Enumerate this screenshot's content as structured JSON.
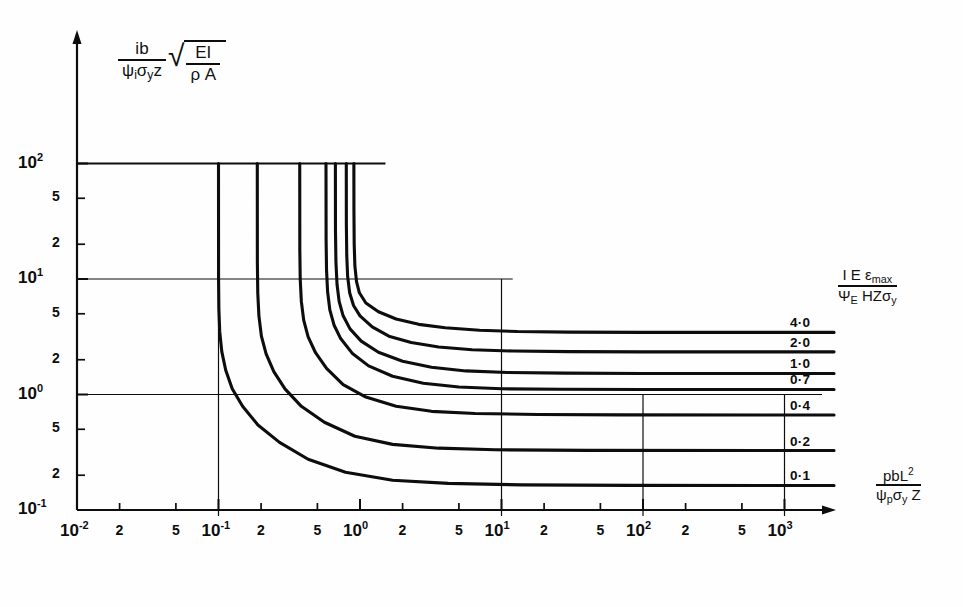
{
  "figure": {
    "kind": "engineering-design-chart",
    "background": "#fefefe",
    "ink": "#0d0d0d"
  },
  "axes": {
    "y_label": {
      "numerator": "ib",
      "denominator_psi": "ψ",
      "denominator_sub": "i",
      "denominator_rest": "σ",
      "denominator_rest_sub": "y",
      "denominator_tail": "z",
      "radical_num": "EI",
      "radical_den_rho": "ρ",
      "radical_den_A": "A"
    },
    "x_label": {
      "numerator_main": "pbL",
      "numerator_exp": "2",
      "den_psi": "ψ",
      "den_psi_sub": "p",
      "den_sigma": "σ",
      "den_sigma_sub": "y",
      "den_tail": "Z"
    },
    "right_label": {
      "num_I": "I",
      "num_E": "E",
      "num_eps": "ε",
      "num_eps_sub": "max",
      "den_psi": "Ψ",
      "den_psi_sub": "E",
      "den_rest": "HZσ",
      "den_rest_sub": "y"
    },
    "x_decades": [
      {
        "label": "10",
        "exp": "-2",
        "value": -2
      },
      {
        "label": "10",
        "exp": "-1",
        "value": -1
      },
      {
        "label": "10",
        "exp": "0",
        "value": 0
      },
      {
        "label": "10",
        "exp": "1",
        "value": 1
      },
      {
        "label": "10",
        "exp": "2",
        "value": 2
      },
      {
        "label": "10",
        "exp": "3",
        "value": 3
      }
    ],
    "x_minor_labels": [
      "2",
      "5"
    ],
    "y_decades": [
      {
        "label": "10",
        "exp": "2",
        "value": 2
      },
      {
        "label": "10",
        "exp": "1",
        "value": 1
      },
      {
        "label": "10",
        "exp": "0",
        "value": 0
      },
      {
        "label": "10",
        "exp": "-1",
        "value": -1
      }
    ],
    "y_minor_labels": [
      "5",
      "2"
    ],
    "x_range": [
      -2,
      3.35
    ],
    "y_range": [
      -1,
      2
    ]
  },
  "chart_data": {
    "type": "line",
    "title": "",
    "xlabel": "pbL^2 / (psi_p sigma_y Z)",
    "ylabel": "ib / (psi_i sigma_y z) * sqrt(EI / rho A)",
    "xscale": "log",
    "yscale": "log",
    "xlim": [
      0.01,
      2239
    ],
    "ylim": [
      0.1,
      100
    ],
    "grid": true,
    "legend_position": "right-inline-labels",
    "series": [
      {
        "name": "4.0",
        "label": "4·0",
        "vertical_asymptote_x": 0.905,
        "horizontal_asymptote_y": 3.45,
        "values": [
          {
            "x": 0.905,
            "y": 100.0
          },
          {
            "x": 0.906,
            "y": 40.0
          },
          {
            "x": 0.91,
            "y": 20.0
          },
          {
            "x": 0.92,
            "y": 13.0
          },
          {
            "x": 0.945,
            "y": 9.5
          },
          {
            "x": 0.99,
            "y": 7.6
          },
          {
            "x": 1.1,
            "y": 6.2
          },
          {
            "x": 1.35,
            "y": 5.2
          },
          {
            "x": 1.8,
            "y": 4.5
          },
          {
            "x": 2.6,
            "y": 4.05
          },
          {
            "x": 4.0,
            "y": 3.78
          },
          {
            "x": 7.0,
            "y": 3.6
          },
          {
            "x": 13.0,
            "y": 3.51
          },
          {
            "x": 30.0,
            "y": 3.47
          },
          {
            "x": 100.0,
            "y": 3.45
          },
          {
            "x": 2239.0,
            "y": 3.45
          }
        ]
      },
      {
        "name": "2.0",
        "label": "2·0",
        "vertical_asymptote_x": 0.8,
        "horizontal_asymptote_y": 2.34,
        "values": [
          {
            "x": 0.8,
            "y": 100.0
          },
          {
            "x": 0.801,
            "y": 30.0
          },
          {
            "x": 0.806,
            "y": 16.0
          },
          {
            "x": 0.818,
            "y": 10.5
          },
          {
            "x": 0.845,
            "y": 7.6
          },
          {
            "x": 0.9,
            "y": 5.9
          },
          {
            "x": 1.0,
            "y": 4.8
          },
          {
            "x": 1.22,
            "y": 3.85
          },
          {
            "x": 1.6,
            "y": 3.2
          },
          {
            "x": 2.3,
            "y": 2.82
          },
          {
            "x": 3.6,
            "y": 2.58
          },
          {
            "x": 6.2,
            "y": 2.44
          },
          {
            "x": 12.0,
            "y": 2.38
          },
          {
            "x": 30.0,
            "y": 2.35
          },
          {
            "x": 100.0,
            "y": 2.34
          },
          {
            "x": 2239.0,
            "y": 2.34
          }
        ]
      },
      {
        "name": "1.0",
        "label": "1·0",
        "vertical_asymptote_x": 0.67,
        "horizontal_asymptote_y": 1.52,
        "values": [
          {
            "x": 0.67,
            "y": 100.0
          },
          {
            "x": 0.671,
            "y": 26.0
          },
          {
            "x": 0.676,
            "y": 14.0
          },
          {
            "x": 0.688,
            "y": 9.0
          },
          {
            "x": 0.712,
            "y": 6.4
          },
          {
            "x": 0.76,
            "y": 4.8
          },
          {
            "x": 0.85,
            "y": 3.7
          },
          {
            "x": 1.02,
            "y": 2.9
          },
          {
            "x": 1.35,
            "y": 2.32
          },
          {
            "x": 2.0,
            "y": 1.94
          },
          {
            "x": 3.2,
            "y": 1.72
          },
          {
            "x": 5.6,
            "y": 1.6
          },
          {
            "x": 11.0,
            "y": 1.55
          },
          {
            "x": 28.0,
            "y": 1.53
          },
          {
            "x": 100.0,
            "y": 1.52
          },
          {
            "x": 2239.0,
            "y": 1.52
          }
        ]
      },
      {
        "name": "0.7",
        "label": "0·7",
        "vertical_asymptote_x": 0.575,
        "horizontal_asymptote_y": 1.105,
        "values": [
          {
            "x": 0.575,
            "y": 100.0
          },
          {
            "x": 0.576,
            "y": 22.0
          },
          {
            "x": 0.58,
            "y": 12.0
          },
          {
            "x": 0.59,
            "y": 7.8
          },
          {
            "x": 0.612,
            "y": 5.4
          },
          {
            "x": 0.655,
            "y": 4.0
          },
          {
            "x": 0.73,
            "y": 3.05
          },
          {
            "x": 0.88,
            "y": 2.28
          },
          {
            "x": 1.15,
            "y": 1.77
          },
          {
            "x": 1.7,
            "y": 1.44
          },
          {
            "x": 2.8,
            "y": 1.25
          },
          {
            "x": 5.0,
            "y": 1.16
          },
          {
            "x": 10.0,
            "y": 1.12
          },
          {
            "x": 26.0,
            "y": 1.11
          },
          {
            "x": 100.0,
            "y": 1.105
          },
          {
            "x": 2239.0,
            "y": 1.105
          }
        ]
      },
      {
        "name": "0.4",
        "label": "0·4",
        "vertical_asymptote_x": 0.375,
        "horizontal_asymptote_y": 0.665,
        "values": [
          {
            "x": 0.375,
            "y": 100.0
          },
          {
            "x": 0.3755,
            "y": 18.0
          },
          {
            "x": 0.378,
            "y": 10.0
          },
          {
            "x": 0.385,
            "y": 6.4
          },
          {
            "x": 0.4,
            "y": 4.4
          },
          {
            "x": 0.43,
            "y": 3.15
          },
          {
            "x": 0.485,
            "y": 2.3
          },
          {
            "x": 0.58,
            "y": 1.68
          },
          {
            "x": 0.76,
            "y": 1.22
          },
          {
            "x": 1.1,
            "y": 0.95
          },
          {
            "x": 1.8,
            "y": 0.79
          },
          {
            "x": 3.2,
            "y": 0.715
          },
          {
            "x": 6.5,
            "y": 0.685
          },
          {
            "x": 18.0,
            "y": 0.672
          },
          {
            "x": 70.0,
            "y": 0.666
          },
          {
            "x": 2239.0,
            "y": 0.665
          }
        ]
      },
      {
        "name": "0.2",
        "label": "0·2",
        "vertical_asymptote_x": 0.188,
        "horizontal_asymptote_y": 0.327,
        "values": [
          {
            "x": 0.188,
            "y": 100.0
          },
          {
            "x": 0.1882,
            "y": 14.0
          },
          {
            "x": 0.1895,
            "y": 7.5
          },
          {
            "x": 0.193,
            "y": 4.8
          },
          {
            "x": 0.201,
            "y": 3.2
          },
          {
            "x": 0.217,
            "y": 2.25
          },
          {
            "x": 0.246,
            "y": 1.58
          },
          {
            "x": 0.295,
            "y": 1.12
          },
          {
            "x": 0.385,
            "y": 0.79
          },
          {
            "x": 0.56,
            "y": 0.575
          },
          {
            "x": 0.92,
            "y": 0.435
          },
          {
            "x": 1.7,
            "y": 0.37
          },
          {
            "x": 3.6,
            "y": 0.343
          },
          {
            "x": 9.0,
            "y": 0.332
          },
          {
            "x": 40.0,
            "y": 0.328
          },
          {
            "x": 2239.0,
            "y": 0.327
          }
        ]
      },
      {
        "name": "0.1",
        "label": "0·1",
        "vertical_asymptote_x": 0.1,
        "horizontal_asymptote_y": 0.163,
        "values": [
          {
            "x": 0.1,
            "y": 100.0
          },
          {
            "x": 0.1001,
            "y": 10.0
          },
          {
            "x": 0.1006,
            "y": 5.5
          },
          {
            "x": 0.102,
            "y": 3.5
          },
          {
            "x": 0.1055,
            "y": 2.35
          },
          {
            "x": 0.1125,
            "y": 1.62
          },
          {
            "x": 0.125,
            "y": 1.12
          },
          {
            "x": 0.148,
            "y": 0.79
          },
          {
            "x": 0.19,
            "y": 0.545
          },
          {
            "x": 0.27,
            "y": 0.385
          },
          {
            "x": 0.43,
            "y": 0.275
          },
          {
            "x": 0.79,
            "y": 0.212
          },
          {
            "x": 1.7,
            "y": 0.181
          },
          {
            "x": 4.2,
            "y": 0.17
          },
          {
            "x": 14.0,
            "y": 0.165
          },
          {
            "x": 80.0,
            "y": 0.1635
          },
          {
            "x": 2239.0,
            "y": 0.163
          }
        ]
      }
    ],
    "gridlines": {
      "vertical_at": [
        0.1,
        10,
        100,
        1000
      ],
      "horizontal_at": [
        100,
        10,
        1
      ]
    }
  }
}
